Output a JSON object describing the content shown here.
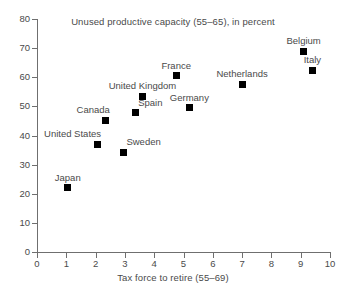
{
  "chart_data": {
    "type": "scatter",
    "title": "Unused productive capacity (55–65), in percent",
    "xlabel": "Tax force to retire (55–69)",
    "ylabel": "",
    "xlim": [
      0,
      10
    ],
    "ylim": [
      0,
      80
    ],
    "xticks": [
      0,
      1,
      2,
      3,
      4,
      5,
      6,
      7,
      8,
      9,
      10
    ],
    "yticks": [
      0,
      10,
      20,
      30,
      40,
      50,
      60,
      70,
      80
    ],
    "xtick_labels": [
      "0",
      "1",
      "2",
      "3",
      "4",
      "5",
      "6",
      "7",
      "8",
      "9",
      "10"
    ],
    "ytick_labels": [
      "0",
      "10",
      "20",
      "30",
      "40",
      "50",
      "60",
      "70",
      "80"
    ],
    "grid": false,
    "legend": "none",
    "marker_color": "#000000",
    "marker_shape": "square",
    "points": [
      {
        "label": "Japan",
        "x": 1.05,
        "y": 22.0,
        "label_pos": "above-center"
      },
      {
        "label": "United States",
        "x": 2.05,
        "y": 37.0,
        "label_pos": "above-left"
      },
      {
        "label": "Sweden",
        "x": 2.95,
        "y": 34.2,
        "label_pos": "above-right"
      },
      {
        "label": "Canada",
        "x": 2.35,
        "y": 45.2,
        "label_pos": "above-left"
      },
      {
        "label": "Spain",
        "x": 3.35,
        "y": 47.8,
        "label_pos": "above-right"
      },
      {
        "label": "United Kingdom",
        "x": 3.6,
        "y": 53.4,
        "label_pos": "above-center"
      },
      {
        "label": "Germany",
        "x": 5.2,
        "y": 49.5,
        "label_pos": "above-center"
      },
      {
        "label": "France",
        "x": 4.75,
        "y": 60.5,
        "label_pos": "above-center"
      },
      {
        "label": "Netherlands",
        "x": 7.0,
        "y": 57.6,
        "label_pos": "above-center"
      },
      {
        "label": "Belgium",
        "x": 9.1,
        "y": 69.0,
        "label_pos": "above-center"
      },
      {
        "label": "Italy",
        "x": 9.4,
        "y": 62.4,
        "label_pos": "above-center"
      }
    ]
  }
}
